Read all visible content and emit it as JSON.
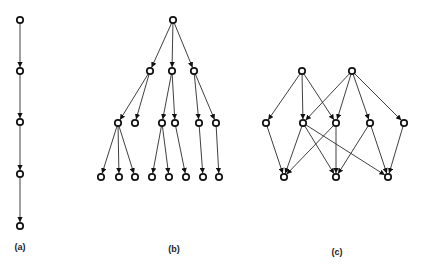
{
  "figure": {
    "colors": {
      "edge": "#2a2a2a",
      "node_stroke": "#111111",
      "node_fill": "#ffffff",
      "background": "#ffffff"
    },
    "panels": [
      {
        "id": "a",
        "label": "(a)",
        "label_pos": [
          20,
          250
        ],
        "type": "chain",
        "nodes": [
          {
            "id": "a1",
            "x": 20,
            "y": 20
          },
          {
            "id": "a2",
            "x": 20,
            "y": 71
          },
          {
            "id": "a3",
            "x": 20,
            "y": 122
          },
          {
            "id": "a4",
            "x": 20,
            "y": 174
          },
          {
            "id": "a5",
            "x": 20,
            "y": 226
          }
        ],
        "edges": [
          [
            "a1",
            "a2"
          ],
          [
            "a2",
            "a3"
          ],
          [
            "a3",
            "a4"
          ],
          [
            "a4",
            "a5"
          ]
        ]
      },
      {
        "id": "b",
        "label": "(b)",
        "label_pos": [
          174,
          252
        ],
        "type": "tree",
        "nodes": [
          {
            "id": "r",
            "x": 173,
            "y": 20
          },
          {
            "id": "m1",
            "x": 150,
            "y": 71
          },
          {
            "id": "m2",
            "x": 172,
            "y": 71
          },
          {
            "id": "m3",
            "x": 194,
            "y": 71
          },
          {
            "id": "n1",
            "x": 118,
            "y": 123
          },
          {
            "id": "n2",
            "x": 135,
            "y": 123
          },
          {
            "id": "n3",
            "x": 162,
            "y": 123
          },
          {
            "id": "n4",
            "x": 175,
            "y": 123
          },
          {
            "id": "n5",
            "x": 199,
            "y": 123
          },
          {
            "id": "n6",
            "x": 216,
            "y": 123
          },
          {
            "id": "l1",
            "x": 101,
            "y": 177
          },
          {
            "id": "l2",
            "x": 119,
            "y": 177
          },
          {
            "id": "l3",
            "x": 135,
            "y": 177
          },
          {
            "id": "l4",
            "x": 152,
            "y": 177
          },
          {
            "id": "l5",
            "x": 169,
            "y": 177
          },
          {
            "id": "l6",
            "x": 186,
            "y": 177
          },
          {
            "id": "l7",
            "x": 203,
            "y": 177
          },
          {
            "id": "l8",
            "x": 219,
            "y": 177
          }
        ],
        "edges": [
          [
            "r",
            "m1"
          ],
          [
            "r",
            "m2"
          ],
          [
            "r",
            "m3"
          ],
          [
            "m1",
            "n1"
          ],
          [
            "m1",
            "n2"
          ],
          [
            "m2",
            "n3"
          ],
          [
            "m2",
            "n4"
          ],
          [
            "m3",
            "n5"
          ],
          [
            "m3",
            "n6"
          ],
          [
            "n1",
            "l1"
          ],
          [
            "n1",
            "l2"
          ],
          [
            "n1",
            "l3"
          ],
          [
            "n3",
            "l4"
          ],
          [
            "n3",
            "l5"
          ],
          [
            "n4",
            "l6"
          ],
          [
            "n5",
            "l7"
          ],
          [
            "n6",
            "l8"
          ]
        ]
      },
      {
        "id": "c",
        "label": "(c)",
        "label_pos": [
          337,
          255
        ],
        "type": "dag",
        "nodes": [
          {
            "id": "t1",
            "x": 302,
            "y": 71
          },
          {
            "id": "t2",
            "x": 352,
            "y": 71
          },
          {
            "id": "c1",
            "x": 266,
            "y": 123
          },
          {
            "id": "c2",
            "x": 303,
            "y": 123
          },
          {
            "id": "c3",
            "x": 336,
            "y": 123
          },
          {
            "id": "c4",
            "x": 370,
            "y": 123
          },
          {
            "id": "c5",
            "x": 404,
            "y": 123
          },
          {
            "id": "b1",
            "x": 284,
            "y": 177
          },
          {
            "id": "b2",
            "x": 336,
            "y": 177
          },
          {
            "id": "b3",
            "x": 388,
            "y": 177
          }
        ],
        "edges": [
          [
            "t1",
            "c1"
          ],
          [
            "t1",
            "c2"
          ],
          [
            "t1",
            "c3"
          ],
          [
            "t2",
            "c2"
          ],
          [
            "t2",
            "c3"
          ],
          [
            "t2",
            "c4"
          ],
          [
            "t2",
            "c5"
          ],
          [
            "c1",
            "b1"
          ],
          [
            "c2",
            "b1"
          ],
          [
            "c2",
            "b2"
          ],
          [
            "c2",
            "b3"
          ],
          [
            "c3",
            "b1"
          ],
          [
            "c3",
            "b2"
          ],
          [
            "c4",
            "b2"
          ],
          [
            "c4",
            "b3"
          ],
          [
            "c5",
            "b3"
          ]
        ]
      }
    ]
  }
}
